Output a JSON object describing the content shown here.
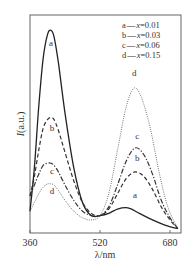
{
  "chart_data": {
    "type": "line",
    "title": "",
    "xlabel": "λ/nm",
    "ylabel": "I(a.u.)",
    "xlim": [
      360,
      705
    ],
    "ylim": [
      0,
      100
    ],
    "xticks": [
      360,
      520,
      680
    ],
    "yticks": [],
    "grid": false,
    "legend_position": "upper right",
    "legend": [
      {
        "key": "a",
        "label": "x=0.01",
        "style": "solid"
      },
      {
        "key": "b",
        "label": "x=0.03",
        "style": "dashed"
      },
      {
        "key": "c",
        "label": "x=0.06",
        "style": "dash-dot"
      },
      {
        "key": "d",
        "label": "x=0.15",
        "style": "dotted"
      }
    ],
    "series": [
      {
        "name": "a",
        "legend": "x=0.01",
        "style": "solid",
        "x": [
          360,
          370,
          380,
          390,
          400,
          408,
          415,
          425,
          440,
          460,
          480,
          500,
          520,
          540,
          560,
          584,
          610,
          640,
          670,
          698
        ],
        "values": [
          10,
          30,
          58,
          80,
          91,
          93,
          90,
          78,
          55,
          30,
          14,
          8,
          8,
          9,
          11,
          11.5,
          9,
          6,
          3.5,
          2
        ]
      },
      {
        "name": "b",
        "legend": "x=0.03",
        "style": "dashed",
        "x": [
          360,
          370,
          380,
          390,
          400,
          408,
          415,
          425,
          440,
          460,
          480,
          500,
          520,
          540,
          560,
          580,
          600,
          620,
          640,
          660,
          680,
          698
        ],
        "values": [
          17,
          26,
          38,
          48,
          52,
          53,
          52,
          47,
          37,
          24,
          14,
          9,
          8,
          11,
          18,
          25,
          28,
          26,
          20,
          12,
          6,
          2
        ]
      },
      {
        "name": "c",
        "legend": "x=0.06",
        "style": "dash-dot",
        "x": [
          360,
          370,
          380,
          390,
          400,
          408,
          415,
          425,
          440,
          460,
          480,
          500,
          520,
          540,
          560,
          580,
          600,
          620,
          640,
          660,
          680,
          698
        ],
        "values": [
          17,
          22,
          27,
          31,
          32,
          32,
          31,
          28,
          22,
          15,
          10,
          8,
          8,
          12,
          22,
          33,
          39,
          36,
          27,
          15,
          7,
          2
        ]
      },
      {
        "name": "d",
        "legend": "x=0.15",
        "style": "dotted",
        "x": [
          360,
          370,
          380,
          390,
          400,
          408,
          415,
          425,
          440,
          460,
          480,
          500,
          520,
          540,
          560,
          580,
          598,
          615,
          635,
          655,
          675,
          698
        ],
        "values": [
          10,
          14,
          18,
          21,
          22.5,
          22.5,
          22,
          19.5,
          15,
          10,
          7,
          6,
          8,
          18,
          38,
          58,
          66.5,
          62,
          48,
          28,
          12,
          2
        ]
      }
    ],
    "curve_labels": [
      {
        "text": "a",
        "x": 408,
        "y": 86
      },
      {
        "text": "b",
        "x": 410,
        "y": 47
      },
      {
        "text": "c",
        "x": 410,
        "y": 27
      },
      {
        "text": "d",
        "x": 410,
        "y": 18
      },
      {
        "text": "d",
        "x": 598,
        "y": 72
      },
      {
        "text": "c",
        "x": 605,
        "y": 43
      },
      {
        "text": "b",
        "x": 605,
        "y": 33
      },
      {
        "text": "a",
        "x": 600,
        "y": 16
      }
    ]
  },
  "legend_entries": [
    "a",
    "b",
    "c",
    "d"
  ],
  "legend_dash": "—",
  "legend_x_var": "x",
  "legend_values": [
    "=0.01",
    "=0.03",
    "=0.06",
    "=0.15"
  ],
  "axes": {
    "x_label": "λ/nm",
    "y_label_var": "I",
    "y_label_unit": "(a.u.)",
    "x_ticks": [
      "360",
      "520",
      "680"
    ]
  }
}
